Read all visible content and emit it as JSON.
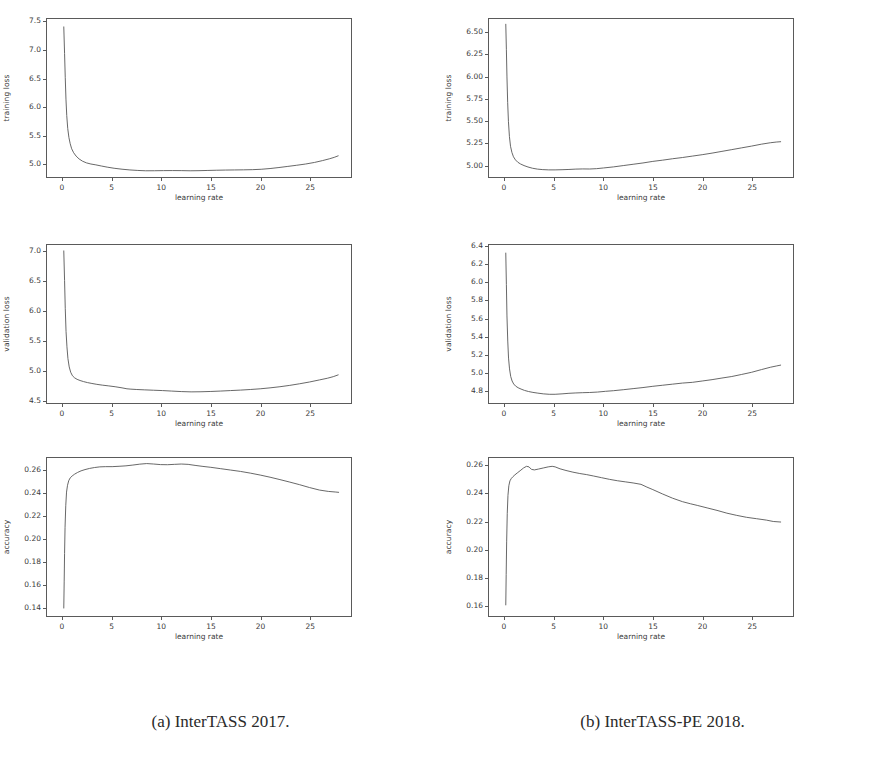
{
  "figure": {
    "background_color": "#ffffff",
    "line_color": "#555555",
    "frame_color": "#5a5a5a",
    "subfigures": [
      {
        "caption": "(a) InterTASS 2017."
      },
      {
        "caption": "(b) InterTASS-PE 2018."
      }
    ]
  },
  "chart_data": [
    {
      "id": "a-training-loss",
      "subfigure": "(a) InterTASS 2017.",
      "type": "line",
      "title": "",
      "xlabel": "learning rate",
      "ylabel": "training loss",
      "xlim": [
        -1.6,
        29.2
      ],
      "ylim": [
        4.76,
        7.56
      ],
      "xticks": [
        0,
        5,
        10,
        15,
        20,
        25
      ],
      "xticklabels": [
        "0",
        "5",
        "10",
        "15",
        "20",
        "25"
      ],
      "yticks": [
        5.0,
        5.5,
        6.0,
        6.5,
        7.0,
        7.5
      ],
      "yticklabels": [
        "5.0",
        "5.5",
        "6.0",
        "6.5",
        "7.0",
        "7.5"
      ],
      "grid": false,
      "legend": null,
      "x": [
        0.1,
        0.18,
        0.25,
        0.32,
        0.4,
        0.5,
        0.62,
        0.75,
        0.9,
        1.1,
        1.35,
        1.65,
        2.0,
        2.4,
        2.85,
        3.35,
        3.9,
        4.5,
        5.2,
        6.0,
        6.8,
        7.6,
        8.4,
        9.3,
        10.2,
        11.1,
        12.0,
        12.9,
        13.8,
        14.7,
        15.6,
        16.5,
        17.4,
        18.3,
        19.2,
        20.1,
        21.0,
        21.9,
        22.8,
        23.7,
        24.6,
        25.5,
        26.3,
        27.0,
        27.5,
        27.9
      ],
      "y": [
        7.42,
        6.95,
        6.52,
        6.14,
        5.85,
        5.62,
        5.46,
        5.35,
        5.26,
        5.19,
        5.13,
        5.08,
        5.04,
        5.01,
        4.99,
        4.975,
        4.955,
        4.935,
        4.915,
        4.898,
        4.885,
        4.876,
        4.87,
        4.871,
        4.873,
        4.874,
        4.873,
        4.87,
        4.872,
        4.876,
        4.88,
        4.883,
        4.885,
        4.887,
        4.89,
        4.897,
        4.91,
        4.928,
        4.948,
        4.968,
        4.99,
        5.018,
        5.05,
        5.082,
        5.108,
        5.135
      ]
    },
    {
      "id": "a-validation-loss",
      "subfigure": "(a) InterTASS 2017.",
      "type": "line",
      "title": "",
      "xlabel": "learning rate",
      "ylabel": "validation loss",
      "xlim": [
        -1.6,
        29.2
      ],
      "ylim": [
        4.45,
        7.12
      ],
      "xticks": [
        0,
        5,
        10,
        15,
        20,
        25
      ],
      "xticklabels": [
        "0",
        "5",
        "10",
        "15",
        "20",
        "25"
      ],
      "yticks": [
        4.5,
        5.0,
        5.5,
        6.0,
        6.5,
        7.0
      ],
      "yticklabels": [
        "4.5",
        "5.0",
        "5.5",
        "6.0",
        "6.5",
        "7.0"
      ],
      "grid": false,
      "legend": null,
      "x": [
        0.1,
        0.18,
        0.25,
        0.33,
        0.42,
        0.52,
        0.65,
        0.8,
        0.98,
        1.2,
        1.45,
        1.75,
        2.1,
        2.5,
        2.95,
        3.45,
        4.0,
        4.6,
        5.3,
        6.0,
        6.5,
        6.9,
        7.5,
        8.3,
        9.2,
        10.1,
        11.0,
        12.0,
        13.0,
        14.0,
        15.0,
        16.0,
        17.0,
        18.0,
        19.0,
        20.0,
        21.0,
        22.0,
        23.0,
        24.0,
        25.0,
        26.0,
        26.8,
        27.4,
        27.9
      ],
      "y": [
        7.02,
        6.52,
        6.05,
        5.66,
        5.4,
        5.2,
        5.06,
        4.97,
        4.91,
        4.875,
        4.85,
        4.83,
        4.812,
        4.795,
        4.78,
        4.765,
        4.752,
        4.74,
        4.725,
        4.706,
        4.69,
        4.684,
        4.678,
        4.672,
        4.666,
        4.66,
        4.652,
        4.643,
        4.638,
        4.64,
        4.645,
        4.652,
        4.66,
        4.668,
        4.678,
        4.69,
        4.706,
        4.725,
        4.748,
        4.775,
        4.805,
        4.84,
        4.868,
        4.895,
        4.925
      ]
    },
    {
      "id": "a-accuracy",
      "subfigure": "(a) InterTASS 2017.",
      "type": "line",
      "title": "",
      "xlabel": "learning rate",
      "ylabel": "accuracy",
      "xlim": [
        -1.6,
        29.2
      ],
      "ylim": [
        0.132,
        0.271
      ],
      "xticks": [
        0,
        5,
        10,
        15,
        20,
        25
      ],
      "xticklabels": [
        "0",
        "5",
        "10",
        "15",
        "20",
        "25"
      ],
      "yticks": [
        0.14,
        0.16,
        0.18,
        0.2,
        0.22,
        0.24,
        0.26
      ],
      "yticklabels": [
        "0.14",
        "0.16",
        "0.18",
        "0.20",
        "0.22",
        "0.24",
        "0.26"
      ],
      "grid": false,
      "legend": null,
      "x": [
        0.1,
        0.14,
        0.18,
        0.23,
        0.3,
        0.38,
        0.48,
        0.6,
        0.75,
        0.95,
        1.2,
        1.5,
        1.85,
        2.25,
        2.7,
        3.2,
        3.75,
        4.35,
        5.0,
        5.7,
        6.4,
        7.1,
        7.8,
        8.5,
        9.2,
        9.9,
        10.6,
        11.3,
        12.0,
        12.7,
        13.4,
        14.2,
        15.0,
        16.0,
        17.0,
        18.0,
        19.0,
        20.0,
        21.0,
        22.0,
        23.0,
        24.0,
        25.0,
        26.0,
        26.9,
        27.6,
        27.95
      ],
      "y": [
        0.139,
        0.162,
        0.187,
        0.21,
        0.229,
        0.241,
        0.247,
        0.251,
        0.2535,
        0.2552,
        0.2568,
        0.2583,
        0.2597,
        0.2608,
        0.2618,
        0.2626,
        0.2632,
        0.2634,
        0.2634,
        0.2637,
        0.2641,
        0.2648,
        0.2656,
        0.2661,
        0.2657,
        0.2652,
        0.2651,
        0.2654,
        0.2657,
        0.2654,
        0.2645,
        0.2636,
        0.2628,
        0.2616,
        0.2604,
        0.2592,
        0.2577,
        0.256,
        0.2541,
        0.252,
        0.2498,
        0.2475,
        0.245,
        0.2428,
        0.2416,
        0.2411,
        0.2408
      ]
    },
    {
      "id": "b-training-loss",
      "subfigure": "(b) InterTASS-PE 2018.",
      "type": "line",
      "title": "",
      "xlabel": "learning rate",
      "ylabel": "training loss",
      "xlim": [
        -1.6,
        29.2
      ],
      "ylim": [
        4.86,
        6.66
      ],
      "xticks": [
        0,
        5,
        10,
        15,
        20,
        25
      ],
      "xticklabels": [
        "0",
        "5",
        "10",
        "15",
        "20",
        "25"
      ],
      "yticks": [
        5.0,
        5.25,
        5.5,
        5.75,
        6.0,
        6.25,
        6.5
      ],
      "yticklabels": [
        "5.00",
        "5.25",
        "5.50",
        "5.75",
        "6.00",
        "6.25",
        "6.50"
      ],
      "grid": false,
      "legend": null,
      "x": [
        0.1,
        0.16,
        0.22,
        0.29,
        0.37,
        0.47,
        0.58,
        0.72,
        0.88,
        1.08,
        1.32,
        1.6,
        1.95,
        2.35,
        2.8,
        3.3,
        3.85,
        4.45,
        5.1,
        5.8,
        6.5,
        7.2,
        7.9,
        8.6,
        9.3,
        10.0,
        11.0,
        12.0,
        13.0,
        14.0,
        15.0,
        16.0,
        17.0,
        18.0,
        19.0,
        20.0,
        21.0,
        22.0,
        23.0,
        24.0,
        25.0,
        26.0,
        26.9,
        27.5,
        27.95
      ],
      "y": [
        6.6,
        6.31,
        6.0,
        5.71,
        5.49,
        5.32,
        5.21,
        5.14,
        5.09,
        5.055,
        5.028,
        5.008,
        4.99,
        4.974,
        4.96,
        4.95,
        4.944,
        4.941,
        4.941,
        4.943,
        4.946,
        4.95,
        4.952,
        4.951,
        4.955,
        4.963,
        4.975,
        4.99,
        5.005,
        5.02,
        5.038,
        5.052,
        5.068,
        5.082,
        5.098,
        5.114,
        5.132,
        5.152,
        5.172,
        5.192,
        5.212,
        5.234,
        5.25,
        5.258,
        5.262
      ]
    },
    {
      "id": "b-validation-loss",
      "subfigure": "(b) InterTASS-PE 2018.",
      "type": "line",
      "title": "",
      "xlabel": "learning rate",
      "ylabel": "validation loss",
      "xlim": [
        -1.6,
        29.2
      ],
      "ylim": [
        4.66,
        6.42
      ],
      "xticks": [
        0,
        5,
        10,
        15,
        20,
        25
      ],
      "xticklabels": [
        "0",
        "5",
        "10",
        "15",
        "20",
        "25"
      ],
      "yticks": [
        4.8,
        5.0,
        5.2,
        5.4,
        5.6,
        5.8,
        6.0,
        6.2,
        6.4
      ],
      "yticklabels": [
        "4.8",
        "5.0",
        "5.2",
        "5.4",
        "5.6",
        "5.8",
        "6.0",
        "6.2",
        "6.4"
      ],
      "grid": false,
      "legend": null,
      "x": [
        0.1,
        0.16,
        0.22,
        0.3,
        0.38,
        0.48,
        0.6,
        0.74,
        0.9,
        1.1,
        1.35,
        1.65,
        2.0,
        2.4,
        2.85,
        3.35,
        3.9,
        4.5,
        5.1,
        5.8,
        6.5,
        7.2,
        7.9,
        8.6,
        9.4,
        10.2,
        11.0,
        12.0,
        13.0,
        14.0,
        15.0,
        16.0,
        17.0,
        18.0,
        19.0,
        20.0,
        21.0,
        22.0,
        23.0,
        24.0,
        25.0,
        26.0,
        26.9,
        27.5,
        27.95
      ],
      "y": [
        6.33,
        5.98,
        5.63,
        5.35,
        5.16,
        5.04,
        4.955,
        4.905,
        4.872,
        4.848,
        4.83,
        4.815,
        4.8,
        4.788,
        4.778,
        4.77,
        4.762,
        4.757,
        4.757,
        4.762,
        4.768,
        4.772,
        4.775,
        4.777,
        4.782,
        4.79,
        4.797,
        4.808,
        4.82,
        4.832,
        4.846,
        4.858,
        4.87,
        4.882,
        4.89,
        4.905,
        4.92,
        4.938,
        4.955,
        4.978,
        5.002,
        5.032,
        5.058,
        5.072,
        5.082
      ]
    },
    {
      "id": "b-accuracy",
      "subfigure": "(b) InterTASS-PE 2018.",
      "type": "line",
      "title": "",
      "xlabel": "learning rate",
      "ylabel": "accuracy",
      "xlim": [
        -1.6,
        29.2
      ],
      "ylim": [
        0.152,
        0.266
      ],
      "xticks": [
        0,
        5,
        10,
        15,
        20,
        25
      ],
      "xticklabels": [
        "0",
        "5",
        "10",
        "15",
        "20",
        "25"
      ],
      "yticks": [
        0.16,
        0.18,
        0.2,
        0.22,
        0.24,
        0.26
      ],
      "yticklabels": [
        "0.16",
        "0.18",
        "0.20",
        "0.22",
        "0.24",
        "0.26"
      ],
      "grid": false,
      "legend": null,
      "x": [
        0.1,
        0.14,
        0.19,
        0.25,
        0.32,
        0.41,
        0.52,
        0.66,
        0.82,
        1.02,
        1.26,
        1.55,
        1.9,
        2.2,
        2.45,
        2.7,
        3.0,
        3.4,
        3.9,
        4.4,
        4.8,
        5.1,
        5.6,
        6.2,
        6.9,
        7.6,
        8.3,
        9.0,
        9.8,
        10.6,
        11.4,
        12.2,
        13.0,
        13.8,
        14.4,
        15.0,
        16.0,
        17.0,
        18.0,
        18.8,
        19.5,
        20.5,
        21.5,
        22.5,
        23.5,
        24.5,
        25.5,
        26.5,
        27.2,
        27.95
      ],
      "y": [
        0.16,
        0.182,
        0.206,
        0.226,
        0.239,
        0.246,
        0.2495,
        0.2512,
        0.2525,
        0.2538,
        0.2552,
        0.2568,
        0.2588,
        0.26,
        0.2596,
        0.2578,
        0.2574,
        0.258,
        0.2588,
        0.2596,
        0.26,
        0.2596,
        0.2582,
        0.257,
        0.2558,
        0.2548,
        0.254,
        0.253,
        0.2518,
        0.2506,
        0.2496,
        0.2488,
        0.248,
        0.247,
        0.245,
        0.2432,
        0.24,
        0.237,
        0.2345,
        0.233,
        0.2318,
        0.23,
        0.2282,
        0.2262,
        0.2246,
        0.2232,
        0.2222,
        0.2212,
        0.2202,
        0.2198
      ]
    }
  ]
}
